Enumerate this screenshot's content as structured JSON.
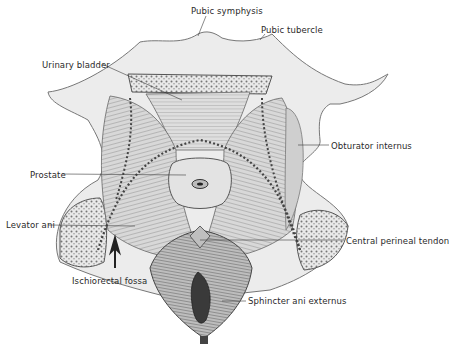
{
  "figure": {
    "type": "anatomical-illustration",
    "view": "Pelvic floor (male) viewed from below, showing muscles of perineum",
    "colors": {
      "background": "#ffffff",
      "ink": "#2a2a2a",
      "bone": "#e6e6e6",
      "muscle": "#cfcfcf",
      "dark": "#555555"
    }
  },
  "labels": [
    {
      "id": "pubic-symphysis",
      "text": "Pubic symphysis",
      "x": 191,
      "y": 6
    },
    {
      "id": "pubic-tubercle",
      "text": "Pubic tubercle",
      "x": 261,
      "y": 25
    },
    {
      "id": "urinary-bladder",
      "text": "Urinary bladder",
      "x": 42,
      "y": 60
    },
    {
      "id": "obturator-internus",
      "text": "Obturator internus",
      "x": 331,
      "y": 141
    },
    {
      "id": "prostate",
      "text": "Prostate",
      "x": 30,
      "y": 170
    },
    {
      "id": "levator-ani",
      "text": "Levator ani",
      "x": 6,
      "y": 220
    },
    {
      "id": "central-perineal-tendon",
      "text": "Central perineal tendon",
      "x": 346,
      "y": 236
    },
    {
      "id": "ischiorectal-fossa",
      "text": "Ischiorectal fossa",
      "x": 72,
      "y": 276
    },
    {
      "id": "sphincter-ani-externus",
      "text": "Sphincter ani externus",
      "x": 248,
      "y": 296
    }
  ]
}
